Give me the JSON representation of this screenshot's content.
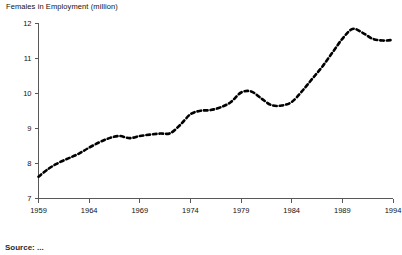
{
  "chart_data": {
    "type": "line",
    "title": "Females in Employment (million)",
    "xlabel": "",
    "ylabel": "",
    "ylim": [
      7,
      12
    ],
    "xlim": [
      1959,
      1994
    ],
    "grid": false,
    "legend": "none",
    "line_style": "dashed",
    "line_color": "#000000",
    "y_ticks": [
      12,
      11,
      10,
      9,
      8,
      7
    ],
    "y_tick_labels": [
      "12",
      "11",
      "10",
      "9",
      "8",
      "7"
    ],
    "x_ticks": [
      1959,
      1964,
      1969,
      1974,
      1979,
      1984,
      1989,
      1994
    ],
    "x_tick_labels": [
      "1959",
      "1964",
      "1969",
      "1974",
      "1979",
      "1984",
      "1989",
      "1994"
    ],
    "x": [
      1959,
      1960,
      1961,
      1962,
      1963,
      1964,
      1965,
      1966,
      1967,
      1968,
      1969,
      1970,
      1971,
      1972,
      1973,
      1974,
      1975,
      1976,
      1977,
      1978,
      1979,
      1980,
      1981,
      1982,
      1983,
      1984,
      1985,
      1986,
      1987,
      1988,
      1989,
      1990,
      1991,
      1992,
      1993,
      1994
    ],
    "values": [
      7.62,
      7.85,
      8.02,
      8.15,
      8.28,
      8.45,
      8.6,
      8.72,
      8.78,
      8.72,
      8.78,
      8.82,
      8.85,
      8.86,
      9.1,
      9.4,
      9.5,
      9.52,
      9.6,
      9.75,
      10.02,
      10.05,
      9.85,
      9.66,
      9.65,
      9.75,
      10.05,
      10.4,
      10.75,
      11.15,
      11.55,
      11.83,
      11.72,
      11.55,
      11.5,
      11.52
    ],
    "annotations": []
  },
  "footer": {
    "source_note": "Source: ..."
  }
}
